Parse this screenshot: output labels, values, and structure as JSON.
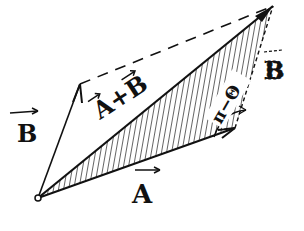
{
  "diagram": {
    "title": "",
    "type": "vector-addition-parallelogram",
    "colors": {
      "ink": "#111111",
      "background": "#ffffff"
    },
    "labels": {
      "vector_b_left": "B",
      "vector_a_bottom": "A",
      "resultant": "A+B",
      "angle": "π−Θ",
      "vector_b_right": "B"
    },
    "nodes": [
      {
        "id": "origin",
        "x": 38,
        "y": 198
      },
      {
        "id": "b_tip",
        "x": 80,
        "y": 84
      },
      {
        "id": "a_tip",
        "x": 235,
        "y": 128
      },
      {
        "id": "sum_tip",
        "x": 273,
        "y": 6
      }
    ],
    "edges": [
      {
        "from": "origin",
        "to": "b_tip",
        "label": "B",
        "style": "solid-arrow"
      },
      {
        "from": "origin",
        "to": "a_tip",
        "label": "A",
        "style": "solid-arrow"
      },
      {
        "from": "origin",
        "to": "sum_tip",
        "label": "A+B",
        "style": "solid-arrow"
      },
      {
        "from": "a_tip",
        "to": "sum_tip",
        "label": "B",
        "style": "dashed"
      },
      {
        "from": "b_tip",
        "to": "sum_tip",
        "label": "",
        "style": "dashed"
      }
    ],
    "shaded_region": "triangle origin–a_tip–sum_tip (hatched)"
  }
}
